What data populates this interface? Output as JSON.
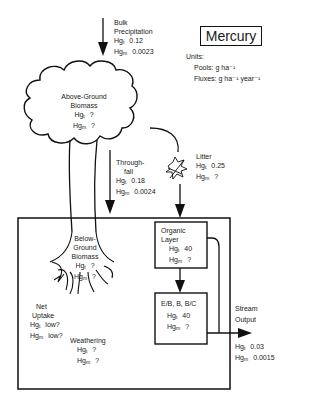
{
  "title": "Mercury",
  "units": {
    "label": "Units:",
    "pools": "Pools: g ha⁻¹",
    "fluxes": "Fluxes: g ha⁻¹ year⁻¹"
  },
  "hg_t": "Hg",
  "sub_t": "t",
  "sub_m": "m",
  "nodes": {
    "bulk_precipitation": {
      "line1": "Bulk",
      "line2": "Precipitation",
      "hg_t": "0.12",
      "hg_m": "0.0023"
    },
    "above_ground_biomass": {
      "line1": "Above-Ground",
      "line2": "Biomass",
      "hg_t": "?",
      "hg_m": "?"
    },
    "throughfall": {
      "line1": "Through-",
      "line2": "fall",
      "hg_t": "0.18",
      "hg_m": "0.0024"
    },
    "litter": {
      "line1": "Litter",
      "hg_t": "0.25",
      "hg_m": "?"
    },
    "below_ground_biomass": {
      "line1": "Below-",
      "line2": "Ground",
      "line3": "Biomass",
      "hg_t": "?",
      "hg_m": "?"
    },
    "organic_layer": {
      "line1": "Organic",
      "line2": "Layer",
      "hg_t": "40",
      "hg_m": "?"
    },
    "eb_horizon": {
      "line1": "E/B, B, B/C",
      "hg_t": "40",
      "hg_m": "?"
    },
    "stream_output": {
      "line1": "Stream",
      "line2": "Output",
      "hg_t": "0.03",
      "hg_m": "0.0015"
    },
    "net_uptake": {
      "line1": "Net",
      "line2": "Uptake",
      "hg_t": "low?",
      "hg_m": "low?"
    },
    "weathering": {
      "line1": "Weathering",
      "hg_t": "?",
      "hg_m": "?"
    }
  },
  "colors": {
    "ink": "#111111",
    "background": "#ffffff"
  }
}
